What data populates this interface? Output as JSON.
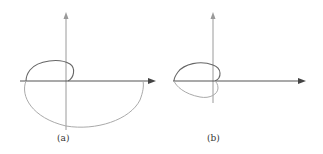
{
  "figure": {
    "panels": [
      {
        "id": "a",
        "caption": "(a)",
        "description": "Polar/Nyquist-style curve: small loop above the real axis near origin, large loop sweeping below the real axis to the right"
      },
      {
        "id": "b",
        "caption": "(b)",
        "description": "Heart-shaped closed curve symmetric about the real axis, lying to the left of the imaginary axis"
      }
    ],
    "colors": {
      "axis": "#9a9a9a",
      "real_axis": "#555555",
      "curve_upper": "#666666",
      "curve_lower": "#aaaaaa",
      "background": "#ffffff"
    }
  }
}
